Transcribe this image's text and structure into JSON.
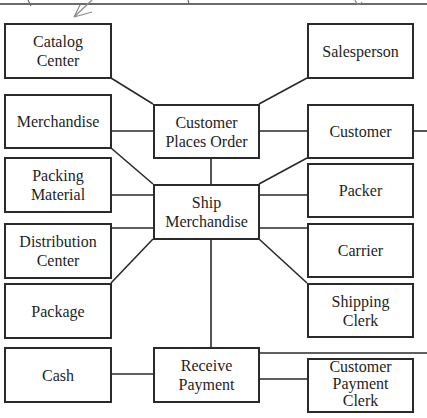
{
  "diagram": {
    "type": "REA-style event/entity diagram",
    "events": [
      {
        "id": "customer_places_order",
        "lines": [
          "Customer",
          "Places Order"
        ]
      },
      {
        "id": "ship_merchandise",
        "lines": [
          "Ship",
          "Merchandise"
        ]
      },
      {
        "id": "receive_payment",
        "lines": [
          "Receive",
          "Payment"
        ]
      }
    ],
    "left_entities": [
      {
        "id": "catalog_center",
        "lines": [
          "Catalog",
          "Center"
        ],
        "connects_to": "customer_places_order"
      },
      {
        "id": "merchandise",
        "lines": [
          "Merchandise"
        ],
        "connects_to": [
          "customer_places_order",
          "ship_merchandise"
        ]
      },
      {
        "id": "packing_material",
        "lines": [
          "Packing",
          "Material"
        ],
        "connects_to": "ship_merchandise"
      },
      {
        "id": "distribution_center",
        "lines": [
          "Distribution",
          "Center"
        ],
        "connects_to": "ship_merchandise"
      },
      {
        "id": "package",
        "lines": [
          "Package"
        ],
        "connects_to": "ship_merchandise"
      },
      {
        "id": "cash",
        "lines": [
          "Cash"
        ],
        "connects_to": "receive_payment"
      }
    ],
    "right_entities": [
      {
        "id": "salesperson",
        "lines": [
          "Salesperson"
        ],
        "connects_to": "customer_places_order"
      },
      {
        "id": "customer",
        "lines": [
          "Customer"
        ],
        "connects_to": [
          "customer_places_order",
          "ship_merchandise",
          "receive_payment"
        ]
      },
      {
        "id": "packer",
        "lines": [
          "Packer"
        ],
        "connects_to": "ship_merchandise"
      },
      {
        "id": "carrier",
        "lines": [
          "Carrier"
        ],
        "connects_to": "ship_merchandise"
      },
      {
        "id": "shipping_clerk",
        "lines": [
          "Shipping",
          "Clerk"
        ],
        "connects_to": "ship_merchandise"
      },
      {
        "id": "customer_payment_clerk",
        "lines": [
          "Customer",
          "Payment",
          "Clerk"
        ],
        "connects_to": "receive_payment"
      }
    ],
    "colors": {
      "line": "#2a2a2a",
      "text": "#1e1e1e",
      "background": "#ffffff",
      "annotation": "#8a8a8a"
    }
  }
}
